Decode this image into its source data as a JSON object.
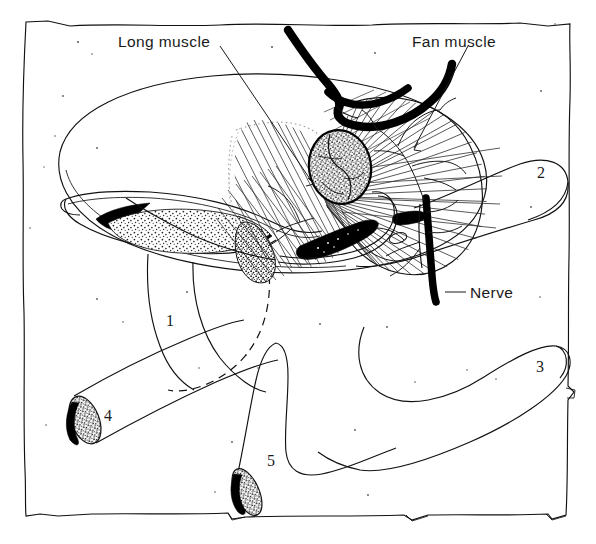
{
  "figure": {
    "background_color": "#ffffff",
    "ink_color": "#111111",
    "style": "hand-drawn pen-and-ink scientific illustration"
  },
  "labels": {
    "long_muscle": "Long muscle",
    "fan_muscle": "Fan muscle",
    "nerve": "Nerve"
  },
  "numbers": {
    "one": "1",
    "two": "2",
    "three": "3",
    "four": "4",
    "five": "5"
  },
  "structures": [
    {
      "name": "outer-frame",
      "description": "hand-drawn rectangular border enclosing the whole figure"
    },
    {
      "name": "body-ellipse",
      "description": "large tilted oval outline forming the main body mass"
    },
    {
      "name": "long-muscle",
      "description": "elongated stippled spindle-shaped muscle across the lower left of the oval"
    },
    {
      "name": "fan-muscle",
      "description": "fan-shaped radiating striated muscle on the right of the oval"
    },
    {
      "name": "central-ganglion",
      "description": "oval stippled nodular mass at the centre of the oval"
    },
    {
      "name": "nerve-trunk",
      "description": "thick black nerve trunk descending from the central region"
    },
    {
      "name": "nerve-branches",
      "description": "fine branching nerve fibres spreading over the fan muscle"
    },
    {
      "name": "thick-black-band",
      "description": "heavy black hooked band entering from the top of the figure"
    },
    {
      "name": "limb-1",
      "description": "appendage outline labelled 1"
    },
    {
      "name": "limb-2",
      "description": "appendage outline labelled 2 extending right"
    },
    {
      "name": "limb-3",
      "description": "appendage outline labelled 3 extending to lower right"
    },
    {
      "name": "limb-4",
      "description": "cut tubular appendage labelled 4 with stippled cut face, lower left"
    },
    {
      "name": "limb-5",
      "description": "cut tubular appendage labelled 5 with stippled cut face, lower centre"
    },
    {
      "name": "dashed-outline",
      "description": "dashed hidden contour arc below the central region"
    }
  ]
}
